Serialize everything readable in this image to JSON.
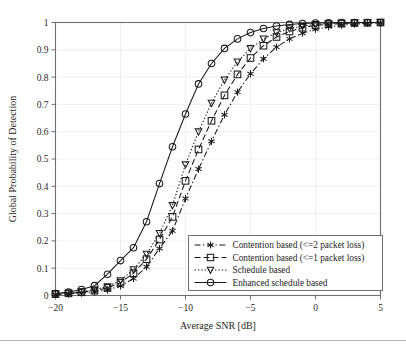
{
  "chart_data": {
    "type": "line",
    "title": "",
    "xlabel": "Average SNR [dB]",
    "ylabel": "Global Probability of Detection",
    "xlim": [
      -20,
      5
    ],
    "ylim": [
      0,
      1
    ],
    "xticks": [
      -20,
      -15,
      -10,
      -5,
      0,
      5
    ],
    "xtick_labels": [
      "−20",
      "−15",
      "−10",
      "−5",
      "0",
      "5"
    ],
    "yticks": [
      0,
      0.1,
      0.2,
      0.3,
      0.4,
      0.5,
      0.6,
      0.7,
      0.8,
      0.9,
      1
    ],
    "ytick_labels": [
      "0",
      "0.1",
      "0.2",
      "0.3",
      "0.4",
      "0.5",
      "0.6",
      "0.7",
      "0.8",
      "0.9",
      "1"
    ],
    "grid": true,
    "legend_position": "lower-right",
    "x": [
      -20,
      -19,
      -18,
      -17,
      -16,
      -15,
      -14,
      -13,
      -12,
      -11,
      -10,
      -9,
      -8,
      -7,
      -6,
      -5,
      -4,
      -3,
      -2,
      -1,
      0,
      1,
      2,
      3,
      4,
      5
    ],
    "series": [
      {
        "name": "Contention based (<=2 packet loss)",
        "marker": "asterisk",
        "linestyle": "dash-dot",
        "values": [
          0.004,
          0.006,
          0.009,
          0.013,
          0.02,
          0.035,
          0.062,
          0.105,
          0.172,
          0.237,
          0.355,
          0.463,
          0.565,
          0.662,
          0.745,
          0.812,
          0.867,
          0.91,
          0.94,
          0.961,
          0.975,
          0.984,
          0.99,
          0.994,
          0.997,
          0.999
        ]
      },
      {
        "name": "Contention based (<=1 packet loss)",
        "marker": "square",
        "linestyle": "dashed",
        "values": [
          0.005,
          0.008,
          0.012,
          0.018,
          0.028,
          0.047,
          0.082,
          0.133,
          0.205,
          0.288,
          0.42,
          0.535,
          0.64,
          0.733,
          0.81,
          0.87,
          0.915,
          0.947,
          0.967,
          0.981,
          0.989,
          0.994,
          0.996,
          0.998,
          0.999,
          1.0
        ]
      },
      {
        "name": "Schedule based",
        "marker": "triangle-down",
        "linestyle": "dotted",
        "values": [
          0.006,
          0.009,
          0.014,
          0.021,
          0.033,
          0.055,
          0.095,
          0.152,
          0.228,
          0.33,
          0.48,
          0.6,
          0.705,
          0.79,
          0.856,
          0.905,
          0.94,
          0.963,
          0.978,
          0.987,
          0.993,
          0.996,
          0.998,
          0.999,
          1.0,
          1.0
        ]
      },
      {
        "name": "Enhanced schedule based",
        "marker": "circle",
        "linestyle": "solid",
        "values": [
          0.007,
          0.013,
          0.022,
          0.036,
          0.078,
          0.128,
          0.175,
          0.27,
          0.41,
          0.545,
          0.665,
          0.775,
          0.85,
          0.905,
          0.94,
          0.963,
          0.978,
          0.987,
          0.993,
          0.996,
          0.998,
          0.999,
          1.0,
          1.0,
          1.0,
          1.0
        ]
      }
    ]
  }
}
